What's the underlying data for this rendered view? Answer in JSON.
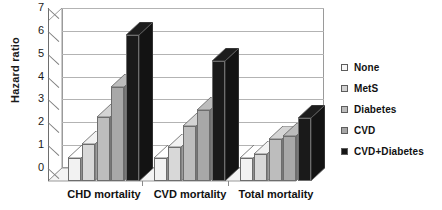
{
  "chart_data": {
    "type": "bar",
    "title": "",
    "xlabel": "",
    "ylabel": "Hazard ratio",
    "ylim": [
      0,
      7
    ],
    "yticks": [
      0,
      1,
      2,
      3,
      4,
      5,
      6,
      7
    ],
    "grid": true,
    "legend_position": "right",
    "style": "3d-clustered-column",
    "categories": [
      "CHD mortality",
      "CVD mortality",
      "Total mortality"
    ],
    "series": [
      {
        "name": "None",
        "color": "#f2f2f2",
        "values": [
          1.0,
          1.0,
          1.0
        ]
      },
      {
        "name": "MetS",
        "color": "#d8d8d8",
        "values": [
          1.6,
          1.5,
          1.2
        ]
      },
      {
        "name": "Diabetes",
        "color": "#bdbdbd",
        "values": [
          2.8,
          2.4,
          1.85
        ]
      },
      {
        "name": "CVD",
        "color": "#a8a8a8",
        "values": [
          4.1,
          3.1,
          1.95
        ]
      },
      {
        "name": "CVD+Diabetes",
        "color": "#1a1a1a",
        "values": [
          6.4,
          5.25,
          2.75
        ]
      }
    ]
  },
  "axis": {
    "y_title": "Hazard ratio",
    "y_tick_labels": [
      "0",
      "1",
      "2",
      "3",
      "4",
      "5",
      "6",
      "7"
    ],
    "x_tick_labels": [
      "CHD mortality",
      "CVD mortality",
      "Total mortality"
    ]
  },
  "legend": {
    "items": [
      {
        "label": "None",
        "swatch": "#f7f7f7"
      },
      {
        "label": "MetS",
        "swatch": "#d2d2d2"
      },
      {
        "label": "Diabetes",
        "swatch": "#bcbcbc"
      },
      {
        "label": "CVD",
        "swatch": "#a6a6a6"
      },
      {
        "label": "CVD+Diabetes",
        "swatch": "#151515"
      }
    ]
  },
  "colors": {
    "background": "#ffffff",
    "gridline": "#b3b3b3",
    "axis": "#6e6e6e",
    "text": "#111111"
  }
}
